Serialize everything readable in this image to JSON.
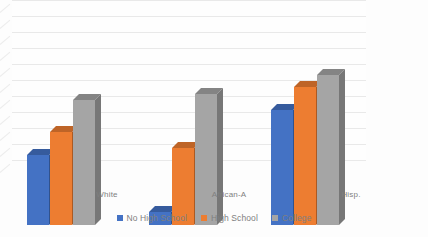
{
  "chart_data": {
    "type": "bar",
    "title": "",
    "subtitle": "",
    "xlabel": "",
    "ylabel": "",
    "categories": [
      "White",
      "African-A",
      "Hisp."
    ],
    "series": [
      {
        "name": "No High School",
        "color": "#4472C4",
        "values": [
          62,
          44,
          76
        ]
      },
      {
        "name": "High School",
        "color": "#ED7D31",
        "values": [
          69,
          64,
          83
        ]
      },
      {
        "name": "College",
        "color": "#A5A5A5",
        "values": [
          79,
          81,
          87
        ]
      }
    ],
    "ylim": [
      40,
      90
    ],
    "ytick_step": 5,
    "yticks": [
      90,
      85,
      80,
      75,
      70,
      65,
      60,
      55,
      50,
      45,
      40
    ],
    "grid": true,
    "legend_position": "bottom",
    "three_d": true
  },
  "legend": {
    "items": [
      {
        "label": "No High School",
        "color": "#4472C4"
      },
      {
        "label": "High School",
        "color": "#ED7D31"
      },
      {
        "label": "College",
        "color": "#A5A5A5"
      }
    ]
  },
  "axis": {
    "y_ticks": [
      "90",
      "85",
      "80",
      "75",
      "70",
      "65",
      "60",
      "55",
      "50",
      "45",
      "40"
    ],
    "x_categories": [
      "White",
      "African-A",
      "Hisp."
    ]
  },
  "colors": {
    "series_blue": "#4472C4",
    "series_orange": "#ED7D31",
    "series_gray": "#A5A5A5",
    "gridline": "#E9E9E9",
    "tick_text": "#8A8A8A",
    "background": "#FDFDFD"
  }
}
